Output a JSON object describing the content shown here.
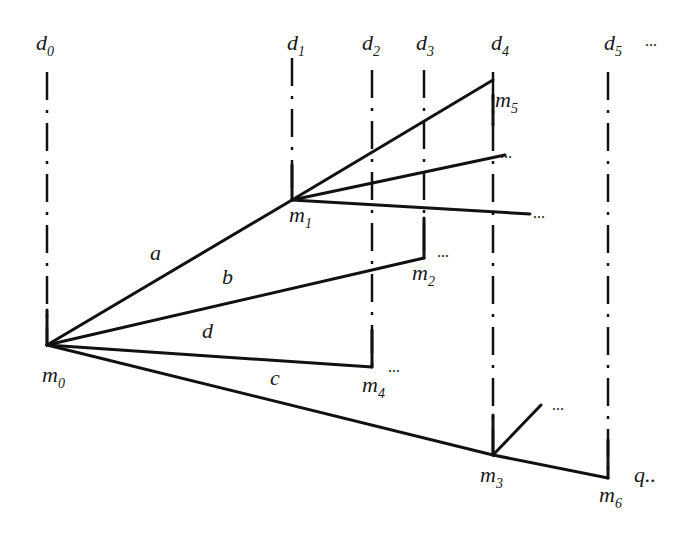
{
  "diagram": {
    "decision_lines": [
      {
        "id": "d0",
        "label": "d",
        "sub": "0",
        "x": 47
      },
      {
        "id": "d1",
        "label": "d",
        "sub": "1",
        "x": 292
      },
      {
        "id": "d2",
        "label": "d",
        "sub": "2",
        "x": 372
      },
      {
        "id": "d3",
        "label": "d",
        "sub": "3",
        "x": 424
      },
      {
        "id": "d4",
        "label": "d",
        "sub": "4",
        "x": 493
      },
      {
        "id": "d5",
        "label": "d",
        "sub": "5",
        "x": 608
      }
    ],
    "top_ellipsis": "...",
    "nodes": [
      {
        "id": "m0",
        "label": "m",
        "sub": "0"
      },
      {
        "id": "m1",
        "label": "m",
        "sub": "1"
      },
      {
        "id": "m2",
        "label": "m",
        "sub": "2"
      },
      {
        "id": "m3",
        "label": "m",
        "sub": "3"
      },
      {
        "id": "m4",
        "label": "m",
        "sub": "4"
      },
      {
        "id": "m5",
        "label": "m",
        "sub": "5"
      },
      {
        "id": "m6",
        "label": "m",
        "sub": "6"
      }
    ],
    "edge_labels": {
      "a": "a",
      "b": "b",
      "c": "c",
      "d": "d"
    },
    "ellipsis": "...",
    "q_label": "q.."
  }
}
